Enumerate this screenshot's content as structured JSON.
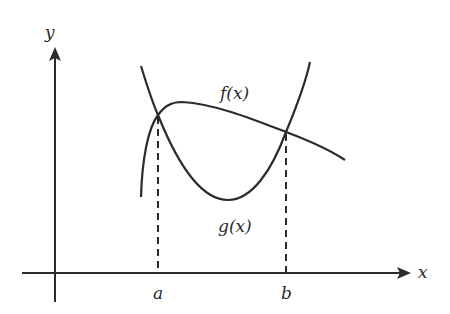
{
  "diagram": {
    "type": "function-graph",
    "colors": {
      "stroke": "#2b2b2b",
      "background": "#ffffff"
    },
    "axes": {
      "x_label": "x",
      "y_label": "y"
    },
    "curves": [
      {
        "name": "f",
        "label": "f(x)",
        "shape": "concave-down, rising then falling"
      },
      {
        "name": "g",
        "label": "g(x)",
        "shape": "concave-up parabola with a minimum between a and b"
      }
    ],
    "intersections": [
      {
        "x_label": "a",
        "description": "left intersection of f(x) and g(x)"
      },
      {
        "x_label": "b",
        "description": "right intersection of f(x) and g(x)"
      }
    ],
    "dashed_lines": [
      "vertical dashed line from intersection at a down to x-axis",
      "vertical dashed line from intersection at b down to x-axis"
    ]
  }
}
